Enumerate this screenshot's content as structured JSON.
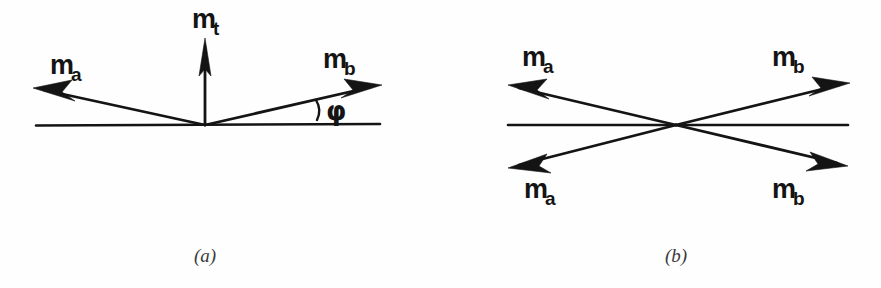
{
  "figure": {
    "background_color": "#fefefe",
    "ink_color": "#141414",
    "caption_color": "#3a3a3a",
    "panels": [
      {
        "id": "a",
        "caption": "(a)",
        "caption_x": 205,
        "caption_y": 262,
        "baseline": {
          "x1": 36,
          "y1": 125,
          "x2": 380,
          "y2": 124
        },
        "vertex": {
          "x": 205,
          "y": 125
        },
        "angle_marker": {
          "arc_label": ")",
          "symbol": "φ",
          "x": 322,
          "y": 112
        },
        "vectors": [
          {
            "name": "m_a",
            "base": "m",
            "subscript": "a",
            "label_x": 50,
            "label_y": 74,
            "from": {
              "x": 205,
              "y": 125
            },
            "to": {
              "x": 33,
              "y": 88
            },
            "direction": "up-left"
          },
          {
            "name": "m_t",
            "base": "m",
            "subscript": "t",
            "label_x": 192,
            "label_y": 28,
            "from": {
              "x": 205,
              "y": 125
            },
            "to": {
              "x": 205,
              "y": 38
            },
            "direction": "up"
          },
          {
            "name": "m_b",
            "base": "m",
            "subscript": "b",
            "label_x": 323,
            "label_y": 68,
            "from": {
              "x": 205,
              "y": 125
            },
            "to": {
              "x": 382,
              "y": 85
            },
            "direction": "up-right"
          }
        ]
      },
      {
        "id": "b",
        "caption": "(b)",
        "caption_x": 676,
        "caption_y": 262,
        "baseline": {
          "x1": 508,
          "y1": 125,
          "x2": 848,
          "y2": 125
        },
        "vertex": {
          "x": 676,
          "y": 125
        },
        "vectors": [
          {
            "name": "m_a upper",
            "base": "m",
            "subscript": "a",
            "label_x": 522,
            "label_y": 66,
            "from": {
              "x": 676,
              "y": 125
            },
            "to": {
              "x": 508,
              "y": 85
            },
            "direction": "up-left"
          },
          {
            "name": "m_b upper",
            "base": "m",
            "subscript": "b",
            "label_x": 772,
            "label_y": 66,
            "from": {
              "x": 676,
              "y": 125
            },
            "to": {
              "x": 850,
              "y": 83
            },
            "direction": "up-right"
          },
          {
            "name": "m_a lower",
            "base": "m",
            "subscript": "a",
            "label_x": 524,
            "label_y": 198,
            "from": {
              "x": 676,
              "y": 125
            },
            "to": {
              "x": 508,
              "y": 168
            },
            "direction": "down-left"
          },
          {
            "name": "m_b lower",
            "base": "m",
            "subscript": "b",
            "label_x": 772,
            "label_y": 198,
            "from": {
              "x": 676,
              "y": 125
            },
            "to": {
              "x": 848,
              "y": 166
            },
            "direction": "down-right"
          }
        ]
      }
    ]
  }
}
